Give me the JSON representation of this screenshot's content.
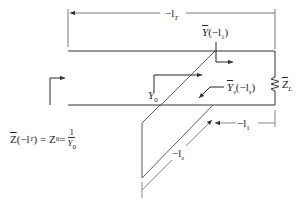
{
  "diagram": {
    "type": "single-stub shunt tuning transmission line",
    "labels": {
      "total_length": "−l",
      "total_length_sub": "T",
      "admittance_at_stub_Y": "Y",
      "admittance_at_stub_arg": "(−l",
      "admittance_at_stub_sub": "1",
      "admittance_at_stub_close": ")",
      "char_admittance": "Y",
      "char_admittance_sub": "0",
      "stub_admittance_Y": "Y",
      "stub_admittance_sub": "s",
      "stub_admittance_arg": "(−l",
      "stub_admittance_arg_sub": "s",
      "stub_admittance_close": ")",
      "load": "Z",
      "load_sub": "L",
      "distance_to_stub": "−l",
      "distance_to_stub_sub": "1",
      "stub_length": "−l",
      "stub_length_sub": "s",
      "input_Z": "Z",
      "input_arg": "(−l",
      "input_arg_sub": "T",
      "input_rest": ") = Z",
      "input_Z0_sub": "0",
      "input_eq": " = ",
      "frac_num": "1",
      "frac_den": "Y",
      "frac_den_sub": "0"
    },
    "colors": {
      "line": "#333333",
      "dim_line": "#555555",
      "background": "#ffffff"
    }
  }
}
